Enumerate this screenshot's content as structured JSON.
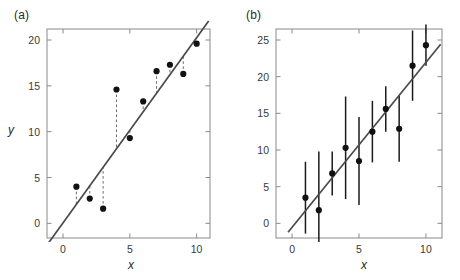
{
  "figure": {
    "background": "#ffffff",
    "line_color": "#4a4a4a",
    "point_color": "#111111",
    "axis_color": "#8a8a8a",
    "text_color": "#2a2a2a"
  },
  "panels": [
    {
      "key": "a",
      "label": "(a)",
      "xlabel": "x",
      "ylabel": "y"
    },
    {
      "key": "b",
      "label": "(b)",
      "xlabel": "x",
      "ylabel": ""
    }
  ],
  "chart_data": [
    {
      "type": "scatter",
      "panel": "(a)",
      "title": "",
      "subtitle": "Least-squares fit with vertical residual lines",
      "xlabel": "x",
      "ylabel": "y",
      "xlim": [
        -1.2,
        11.0
      ],
      "ylim": [
        -1.6,
        21.2
      ],
      "xticks": [
        0,
        5,
        10
      ],
      "xticklabels": [
        "0",
        "5",
        "10"
      ],
      "yticks": [
        0,
        5,
        10,
        15,
        20
      ],
      "yticklabels": [
        "0",
        "5",
        "10",
        "15",
        "20"
      ],
      "grid": false,
      "legend": false,
      "x": [
        1,
        2,
        3,
        4,
        5,
        6,
        7,
        8,
        9,
        10
      ],
      "values": [
        4.0,
        2.7,
        1.6,
        14.6,
        9.3,
        13.3,
        16.6,
        17.3,
        16.3,
        19.6
      ],
      "fit_line": {
        "slope": 2.02,
        "intercept": 0.05,
        "x_start": -1.1,
        "x_end": 10.9,
        "style": "solid"
      },
      "residuals": {
        "style": "dashed",
        "description": "vertical dashed segments from each point to the fitted line",
        "segments": [
          {
            "x": 1,
            "y_point": 4.0,
            "y_line": 2.07
          },
          {
            "x": 2,
            "y_point": 2.7,
            "y_line": 4.09
          },
          {
            "x": 3,
            "y_point": 1.6,
            "y_line": 6.11
          },
          {
            "x": 4,
            "y_point": 14.6,
            "y_line": 8.13
          },
          {
            "x": 5,
            "y_point": 9.3,
            "y_line": 10.15
          },
          {
            "x": 6,
            "y_point": 13.3,
            "y_line": 12.17
          },
          {
            "x": 7,
            "y_point": 16.6,
            "y_line": 14.19
          },
          {
            "x": 8,
            "y_point": 17.3,
            "y_line": 16.21
          },
          {
            "x": 9,
            "y_point": 16.3,
            "y_line": 18.23
          },
          {
            "x": 10,
            "y_point": 19.6,
            "y_line": 20.25
          }
        ]
      }
    },
    {
      "type": "scatter",
      "panel": "(b)",
      "title": "",
      "subtitle": "Least-squares fit with symmetric vertical error bars",
      "xlabel": "x",
      "ylabel": "",
      "xlim": [
        -1.2,
        11.2
      ],
      "ylim": [
        -2.0,
        26.5
      ],
      "xticks": [
        0,
        5,
        10
      ],
      "xticklabels": [
        "0",
        "5",
        "10"
      ],
      "yticks": [
        0,
        5,
        10,
        15,
        20,
        25
      ],
      "yticklabels": [
        "0",
        "5",
        "10",
        "15",
        "20",
        "25"
      ],
      "grid": false,
      "legend": false,
      "x": [
        1,
        2,
        3,
        4,
        5,
        6,
        7,
        8,
        9,
        10
      ],
      "values": [
        3.5,
        1.8,
        6.8,
        10.3,
        8.5,
        12.5,
        15.6,
        12.9,
        21.5,
        24.3
      ],
      "errors": [
        4.9,
        8.0,
        3.0,
        7.0,
        6.0,
        4.2,
        3.1,
        4.5,
        4.8,
        2.8
      ],
      "error_bar_style": "plain vertical line, no caps",
      "fit_line": {
        "slope": 2.25,
        "intercept": -0.55,
        "x_start": -0.3,
        "x_end": 11.1,
        "style": "solid"
      }
    }
  ]
}
